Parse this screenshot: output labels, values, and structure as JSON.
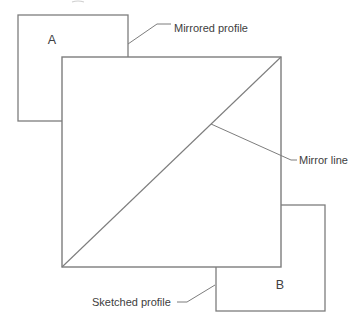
{
  "diagram": {
    "shape_labels": {
      "square_a": "A",
      "square_b": "B"
    },
    "annotations": {
      "mirrored_profile": "Mirrored profile",
      "mirror_line": "Mirror line",
      "sketched_profile": "Sketched profile"
    },
    "colors": {
      "line": "#7d7d7d",
      "text": "#404040",
      "background": "#ffffff"
    }
  }
}
